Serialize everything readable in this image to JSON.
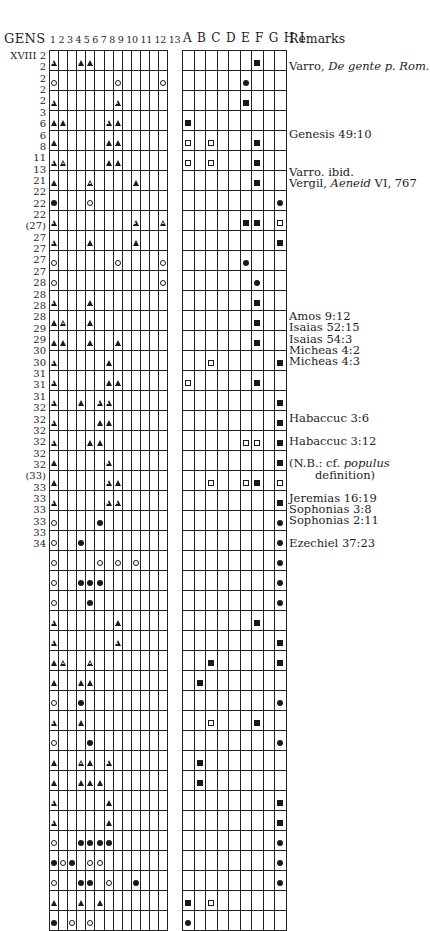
{
  "headers": {
    "gens": "GENS",
    "numbers": "1 2 3 4 5 6 7 8 9 10 11 12 13",
    "letters": "A B C D E F G H I",
    "remarks": "Remarks"
  },
  "legend": {
    "T": "filled triangle",
    "t": "open triangle",
    "C": "filled circle",
    "c": "open circle",
    "S": "filled square",
    "s": "open square"
  },
  "rows": [
    {
      "gens": "XVIII 2",
      "left": [
        "t",
        "",
        "",
        "S0",
        "",
        "",
        "",
        "",
        "",
        "",
        "",
        "",
        ""
      ],
      "right": [
        "",
        "",
        "",
        "",
        "",
        "",
        "S",
        "",
        ""
      ]
    },
    {
      "gens": "2",
      "left": [
        "c",
        "",
        "",
        "",
        "",
        "",
        "",
        "c",
        "",
        "",
        "",
        "",
        "c"
      ],
      "right": [
        "",
        "",
        "",
        "",
        "",
        "C",
        "",
        "",
        ""
      ]
    },
    {
      "gens": "2",
      "left": [
        "t",
        "",
        "",
        "",
        "",
        "",
        "",
        "t",
        "",
        "",
        "",
        "",
        ""
      ],
      "right": [
        "",
        "",
        "",
        "",
        "",
        "S",
        "",
        "",
        ""
      ]
    },
    {
      "gens": "2",
      "left": [
        "T",
        "T",
        "",
        "",
        "",
        "",
        "t",
        "T",
        "",
        "",
        "",
        "",
        ""
      ],
      "right": [
        "S",
        "",
        "",
        "",
        "",
        "",
        "",
        "",
        ""
      ]
    },
    {
      "gens": "2",
      "left": [
        "T",
        "",
        "",
        "",
        "",
        "",
        "T",
        "T",
        "",
        "",
        "",
        "",
        ""
      ],
      "right": [
        "s",
        "",
        "s",
        "",
        "",
        "",
        "S",
        "",
        ""
      ]
    },
    {
      "gens": "3",
      "left": [
        "t",
        "t",
        "",
        "",
        "",
        "",
        "T",
        "T",
        "",
        "",
        "",
        "",
        ""
      ],
      "right": [
        "s",
        "",
        "s",
        "",
        "",
        "",
        "S",
        "",
        ""
      ]
    },
    {
      "gens": "6",
      "left": [
        "T",
        "",
        "",
        "",
        "t",
        "",
        "",
        "",
        "",
        "T",
        "",
        "",
        ""
      ],
      "right": [
        "",
        "",
        "",
        "",
        "",
        "",
        "S",
        "",
        ""
      ]
    },
    {
      "gens": "6",
      "left": [
        "C",
        "",
        "",
        "",
        "c",
        "",
        "",
        "",
        "",
        "",
        "",
        "",
        ""
      ],
      "right": [
        "",
        "",
        "",
        "",
        "",
        "",
        "",
        "",
        "C"
      ]
    },
    {
      "gens": "8",
      "left": [
        "t",
        "",
        "",
        "",
        "",
        "",
        "",
        "",
        "",
        "t",
        "",
        "",
        "t"
      ],
      "right": [
        "",
        "",
        "",
        "",
        "",
        "S",
        "S",
        "",
        "s"
      ]
    },
    {
      "gens": "11",
      "left": [
        "t",
        "",
        "",
        "",
        "T",
        "",
        "",
        "",
        "",
        "T",
        "",
        "",
        ""
      ],
      "right": [
        "",
        "",
        "",
        "",
        "",
        "",
        "",
        "",
        "S"
      ]
    },
    {
      "gens": "13",
      "left": [
        "c",
        "",
        "",
        "",
        "",
        "",
        "",
        "c",
        "",
        "",
        "",
        "",
        "c"
      ],
      "right": [
        "",
        "",
        "",
        "",
        "",
        "C",
        "",
        "",
        ""
      ]
    },
    {
      "gens": "21",
      "left": [
        "c",
        "",
        "",
        "",
        "",
        "",
        "",
        "",
        "",
        "",
        "",
        "",
        "c"
      ],
      "right": [
        "",
        "",
        "",
        "",
        "",
        "",
        "C",
        "",
        ""
      ]
    },
    {
      "gens": "22",
      "left": [
        "t",
        "",
        "",
        "",
        "T",
        "",
        "",
        "",
        "",
        "",
        "",
        "",
        ""
      ],
      "right": [
        "",
        "",
        "",
        "",
        "",
        "",
        "S",
        "",
        ""
      ]
    },
    {
      "gens": "22",
      "left": [
        "T",
        "t",
        "",
        "",
        "T",
        "",
        "",
        "",
        "",
        "",
        "",
        "",
        ""
      ],
      "right": [
        "",
        "",
        "",
        "",
        "",
        "",
        "S",
        "",
        ""
      ]
    },
    {
      "gens": "22",
      "left": [
        "T",
        "T",
        "",
        "",
        "T",
        "",
        "",
        "T",
        "",
        "",
        "",
        "",
        ""
      ],
      "right": [
        "",
        "",
        "",
        "",
        "",
        "",
        "S",
        "",
        ""
      ]
    },
    {
      "gens": "(27)",
      "left": [
        "t",
        "",
        "",
        "",
        "",
        "",
        "T",
        "",
        "",
        "",
        "",
        "",
        ""
      ],
      "right": [
        "",
        "",
        "s",
        "",
        "",
        "",
        "",
        "",
        "S"
      ]
    },
    {
      "gens": "27",
      "left": [
        "t",
        "",
        "",
        "",
        "",
        "",
        "T",
        "T",
        "",
        "",
        "",
        "",
        ""
      ],
      "right": [
        "s",
        "",
        "",
        "",
        "",
        "",
        "S",
        "",
        ""
      ]
    },
    {
      "gens": "27",
      "left": [
        "t",
        "",
        "",
        "T",
        "",
        "t",
        "t",
        "",
        "",
        "",
        "",
        "",
        ""
      ],
      "right": [
        "",
        "",
        "",
        "",
        "",
        "",
        "",
        "",
        "S"
      ]
    },
    {
      "gens": "27",
      "left": [
        "t",
        "",
        "",
        "",
        "",
        "T",
        "T",
        "",
        "",
        "",
        "",
        "",
        ""
      ],
      "right": [
        "",
        "",
        "",
        "",
        "",
        "",
        "",
        "",
        "S"
      ]
    },
    {
      "gens": "27",
      "left": [
        "t",
        "",
        "",
        "",
        "T",
        "T",
        "",
        "",
        "",
        "",
        "",
        "",
        ""
      ],
      "right": [
        "",
        "",
        "",
        "",
        "",
        "s",
        "s",
        "",
        "S"
      ]
    },
    {
      "gens": "28",
      "left": [
        "T",
        "",
        "",
        "",
        "",
        "",
        "t",
        "",
        "",
        "",
        "",
        "",
        ""
      ],
      "right": [
        "",
        "",
        "",
        "",
        "",
        "",
        "",
        "",
        "S"
      ]
    },
    {
      "gens": "28",
      "left": [
        "T",
        "",
        "",
        "",
        "",
        "",
        "t",
        "T",
        "",
        "",
        "",
        "",
        ""
      ],
      "right": [
        "",
        "",
        "s",
        "",
        "",
        "s",
        "S",
        "",
        "s"
      ]
    },
    {
      "gens": "28",
      "left": [
        "t",
        "",
        "",
        "",
        "",
        "",
        "t",
        "t",
        "",
        "",
        "",
        "",
        ""
      ],
      "right": [
        "",
        "",
        "",
        "",
        "",
        "",
        "",
        "",
        "S"
      ]
    },
    {
      "gens": "28",
      "left": [
        "c",
        "",
        "",
        "",
        "",
        "C",
        "",
        "",
        "",
        "",
        "",
        "",
        ""
      ],
      "right": [
        "",
        "",
        "",
        "",
        "",
        "",
        "",
        "",
        "C"
      ]
    },
    {
      "gens": "29",
      "left": [
        "c",
        "",
        "",
        "C",
        "",
        "",
        "",
        "",
        "",
        "",
        "",
        "",
        ""
      ],
      "right": [
        "",
        "",
        "",
        "",
        "",
        "",
        "",
        "",
        "C"
      ]
    },
    {
      "gens": "29",
      "left": [
        "c",
        "",
        "",
        "",
        "",
        "c",
        "",
        "c",
        "",
        "c",
        "",
        "",
        ""
      ],
      "right": [
        "",
        "",
        "",
        "",
        "",
        "",
        "",
        "",
        "C"
      ]
    },
    {
      "gens": "30",
      "left": [
        "c",
        "",
        "",
        "C",
        "C",
        "C",
        "",
        "",
        "",
        "",
        "",
        "",
        ""
      ],
      "right": [
        "",
        "",
        "",
        "",
        "",
        "",
        "",
        "",
        "C"
      ]
    },
    {
      "gens": "30",
      "left": [
        "c",
        "",
        "",
        "",
        "C",
        "",
        "",
        "",
        "",
        "",
        "",
        "",
        ""
      ],
      "right": [
        "",
        "",
        "",
        "",
        "",
        "",
        "",
        "",
        "C"
      ]
    },
    {
      "gens": "31",
      "left": [
        "t",
        "",
        "",
        "",
        "",
        "",
        "",
        "T",
        "",
        "",
        "",
        "",
        ""
      ],
      "right": [
        "",
        "",
        "",
        "",
        "",
        "",
        "S",
        "",
        ""
      ]
    },
    {
      "gens": "31",
      "left": [
        "t",
        "",
        "",
        "",
        "",
        "",
        "",
        "t",
        "",
        "",
        "",
        "",
        ""
      ],
      "right": [
        "",
        "",
        "",
        "",
        "",
        "",
        "",
        "",
        "S"
      ]
    },
    {
      "gens": "31",
      "left": [
        "T",
        "t",
        "",
        "",
        "t",
        "",
        "",
        "",
        "",
        "",
        "",
        "",
        ""
      ],
      "right": [
        "",
        "",
        "S",
        "",
        "",
        "",
        "",
        "",
        "S"
      ]
    },
    {
      "gens": "32",
      "left": [
        "T",
        "",
        "",
        "T",
        "T",
        "",
        "",
        "",
        "",
        "",
        "",
        "",
        ""
      ],
      "right": [
        "",
        "S",
        "",
        "",
        "",
        "",
        "",
        "",
        ""
      ]
    },
    {
      "gens": "32",
      "left": [
        "c",
        "",
        "",
        "C",
        "",
        "",
        "",
        "",
        "",
        "",
        "",
        "",
        ""
      ],
      "right": [
        "",
        "",
        "",
        "",
        "",
        "",
        "",
        "",
        "C"
      ]
    },
    {
      "gens": "32",
      "left": [
        "t",
        "",
        "",
        "T",
        "",
        "",
        "",
        "",
        "",
        "",
        "",
        "",
        ""
      ],
      "right": [
        "",
        "",
        "s",
        "",
        "",
        "",
        "S",
        "",
        ""
      ]
    },
    {
      "gens": "32",
      "left": [
        "c",
        "",
        "",
        "",
        "C",
        "",
        "",
        "",
        "",
        "",
        "",
        "",
        ""
      ],
      "right": [
        "",
        "",
        "",
        "",
        "",
        "",
        "",
        "",
        "C"
      ]
    },
    {
      "gens": "32",
      "left": [
        "T",
        "",
        "",
        "t",
        "T",
        "",
        "t",
        "",
        "",
        "",
        "",
        "",
        ""
      ],
      "right": [
        "",
        "S",
        "",
        "",
        "",
        "",
        "",
        "",
        ""
      ]
    },
    {
      "gens": "32",
      "left": [
        "T",
        "",
        "",
        "T",
        "T",
        "T",
        "",
        "",
        "",
        "",
        "",
        "",
        ""
      ],
      "right": [
        "",
        "S",
        "",
        "",
        "",
        "",
        "",
        "",
        ""
      ]
    },
    {
      "gens": "(33)",
      "left": [
        "t",
        "",
        "",
        "",
        "",
        "",
        "T",
        "",
        "",
        "",
        "",
        "",
        ""
      ],
      "right": [
        "",
        "",
        "",
        "",
        "",
        "",
        "",
        "",
        "S"
      ]
    },
    {
      "gens": "33",
      "left": [
        "t",
        "",
        "",
        "",
        "",
        "",
        "T",
        "",
        "",
        "",
        "",
        "",
        ""
      ],
      "right": [
        "",
        "",
        "",
        "",
        "",
        "",
        "",
        "",
        "S"
      ]
    },
    {
      "gens": "33",
      "left": [
        "c",
        "",
        "",
        "C",
        "C",
        "C",
        "C",
        "",
        "",
        "",
        "",
        "",
        ""
      ],
      "right": [
        "",
        "",
        "",
        "",
        "",
        "",
        "",
        "",
        "C"
      ]
    },
    {
      "gens": "33",
      "left": [
        "C",
        "c",
        "C",
        "",
        "c",
        "c",
        "",
        "",
        "",
        "",
        "",
        "",
        ""
      ],
      "right": [
        "",
        "",
        "",
        "",
        "",
        "",
        "",
        "",
        "C"
      ]
    },
    {
      "gens": "33",
      "left": [
        "c",
        "",
        "",
        "C",
        "C",
        "",
        "c",
        "",
        "",
        "C",
        "",
        "",
        ""
      ],
      "right": [
        "",
        "",
        "",
        "",
        "",
        "",
        "",
        "",
        "C"
      ]
    },
    {
      "gens": "33",
      "left": [
        "T",
        "",
        "",
        "T",
        "",
        "T",
        "",
        "",
        "",
        "",
        "",
        "",
        ""
      ],
      "right": [
        "S",
        "",
        "s",
        "",
        "",
        "",
        "",
        "",
        ""
      ]
    },
    {
      "gens": "34",
      "left": [
        "C",
        "",
        "c",
        "",
        "c",
        "",
        "",
        "",
        "",
        "",
        "",
        "",
        ""
      ],
      "right": [
        "C",
        "",
        "",
        "",
        "",
        "",
        "",
        "",
        ""
      ]
    }
  ],
  "remarks": [
    {
      "row": 1,
      "text": "Varro, ",
      "italic": "De gente p. Rom.",
      "after": ""
    },
    {
      "row": 7,
      "text": "Genesis 49:10",
      "italic": "",
      "after": ""
    },
    {
      "row": 10.3,
      "text": "Varro. ibid.",
      "italic": "",
      "after": ""
    },
    {
      "row": 11.3,
      "text": "Vergil, ",
      "italic": "Aeneid",
      "after": " VI, 767"
    },
    {
      "row": 23,
      "text": "Amos 9:12",
      "italic": "",
      "after": ""
    },
    {
      "row": 24,
      "text": "Isaias 52:15",
      "italic": "",
      "after": ""
    },
    {
      "row": 25,
      "text": "Isaias 54:3",
      "italic": "",
      "after": ""
    },
    {
      "row": 26,
      "text": "Micheas 4:2",
      "italic": "",
      "after": ""
    },
    {
      "row": 27,
      "text": "Micheas 4:3",
      "italic": "",
      "after": ""
    },
    {
      "row": 32,
      "text": "Habaccuc 3:6",
      "italic": "",
      "after": ""
    },
    {
      "row": 34,
      "text": "Habaccuc 3:12",
      "italic": "",
      "after": ""
    },
    {
      "row": 36,
      "text": "(N.B.: cf. ",
      "italic": "populus",
      "after": ""
    },
    {
      "row": 37,
      "text": "        definition)",
      "italic": "",
      "after": ""
    },
    {
      "row": 39,
      "text": "Jeremias 16:19",
      "italic": "",
      "after": ""
    },
    {
      "row": 40,
      "text": "Sophonias 3:8",
      "italic": "",
      "after": ""
    },
    {
      "row": 41,
      "text": "Sophonias 2:11",
      "italic": "",
      "after": ""
    },
    {
      "row": 43,
      "text": "Ezechiel 37:23",
      "italic": "",
      "after": ""
    }
  ]
}
